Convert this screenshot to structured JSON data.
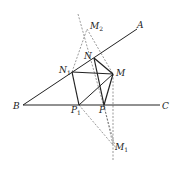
{
  "diagram": {
    "labels": {
      "A": "A",
      "B": "B",
      "C": "C",
      "M": "M",
      "N": "N",
      "N1_base": "N",
      "N1_sub": "1",
      "P": "P",
      "P1_base": "P",
      "P1_sub": "1",
      "M1_base": "M",
      "M1_sub": "1",
      "M2_base": "M",
      "M2_sub": "2"
    },
    "points": {
      "B": [
        23,
        105
      ],
      "C_end": [
        160,
        105
      ],
      "A_end": [
        137,
        29
      ],
      "M": [
        113,
        74
      ],
      "N": [
        94,
        58
      ],
      "N1": [
        72,
        72
      ],
      "P": [
        104,
        105
      ],
      "P1": [
        79,
        105
      ],
      "M1": [
        113,
        145
      ],
      "M2": [
        87,
        29
      ]
    },
    "colors": {
      "solid": "#222222",
      "dashed": "#555555"
    }
  }
}
